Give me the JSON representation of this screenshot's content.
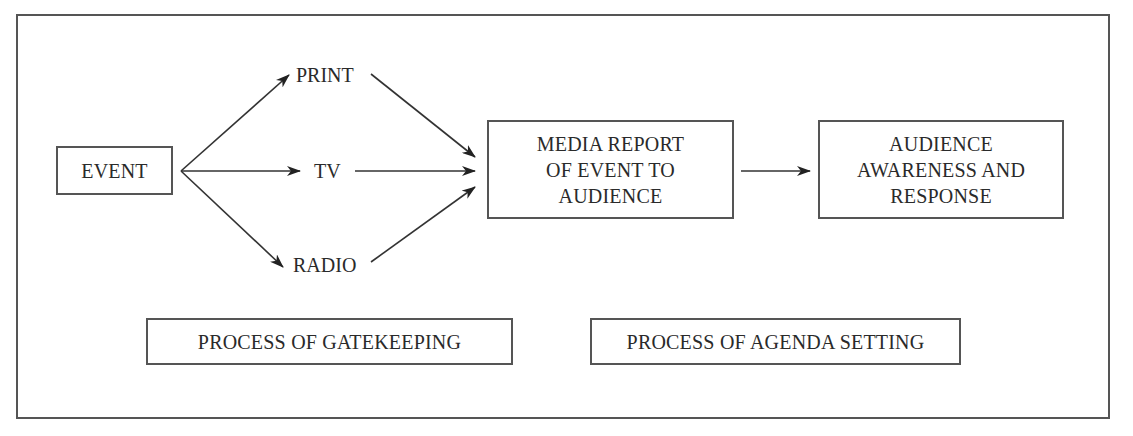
{
  "diagram": {
    "type": "flow",
    "nodes": {
      "event": "EVENT",
      "print": "PRINT",
      "tv": "TV",
      "radio": "RADIO",
      "media_report": [
        "MEDIA REPORT",
        "OF EVENT TO",
        "AUDIENCE"
      ],
      "audience": [
        "AUDIENCE",
        "AWARENESS AND",
        "RESPONSE"
      ]
    },
    "processes": {
      "gatekeeping": "PROCESS OF GATEKEEPING",
      "agenda_setting": "PROCESS OF AGENDA SETTING"
    },
    "edges": [
      {
        "from": "event",
        "to": "print"
      },
      {
        "from": "event",
        "to": "tv"
      },
      {
        "from": "event",
        "to": "radio"
      },
      {
        "from": "print",
        "to": "media_report"
      },
      {
        "from": "tv",
        "to": "media_report"
      },
      {
        "from": "radio",
        "to": "media_report"
      },
      {
        "from": "media_report",
        "to": "audience"
      }
    ],
    "colors": {
      "stroke": "#555555",
      "text": "#2a2a2a",
      "background": "#ffffff"
    }
  }
}
